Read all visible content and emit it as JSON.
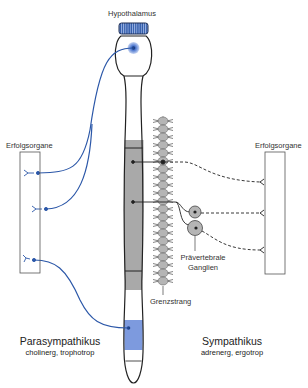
{
  "labels": {
    "hypothalamus": "Hypothalamus",
    "effector_left": "Erfolgsorgane",
    "effector_right": "Erfolgsorgane",
    "prevertebral_line1": "Prävertebrale",
    "prevertebral_line2": "Ganglien",
    "sympathetic_trunk": "Grenzstrang",
    "parasympathetic_title": "Parasympathikus",
    "parasympathetic_sub": "cholinerg, trophotrop",
    "sympathetic_title": "Sympathikus",
    "sympathetic_sub": "adrenerg, ergotrop"
  },
  "colors": {
    "parasympathetic_blue": "#2b57a8",
    "parasympathetic_fill": "#7c99de",
    "sympathetic_gray": "#a6a6a6",
    "ganglion_gray": "#b8b8b8",
    "outline": "#222222"
  },
  "structure": {
    "parasympathetic_pathways": 3,
    "sympathetic_pathways": 3,
    "trunk_ganglia_count": 22,
    "prevertebral_ganglia_count": 2
  }
}
